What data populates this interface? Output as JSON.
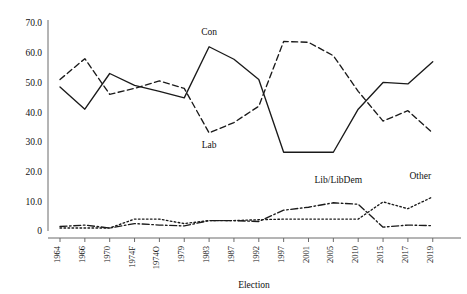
{
  "chart_data": {
    "type": "line",
    "title": "",
    "xlabel": "Election",
    "ylabel": "",
    "ylim": [
      0,
      75
    ],
    "yticks": [
      0,
      10,
      20,
      30,
      40,
      50,
      60,
      70
    ],
    "ytick_labels": [
      "0",
      "10.0",
      "20.0",
      "30.0",
      "40.0",
      "50.0",
      "60.0",
      "70.0"
    ],
    "grid": false,
    "legend_position": "inline-annotations",
    "categories": [
      "1964",
      "1966",
      "1970",
      "1974F",
      "1974O",
      "1979",
      "1983",
      "1987",
      "1992",
      "1997",
      "2001",
      "2005",
      "2010",
      "2015",
      "2017",
      "2019"
    ],
    "series": [
      {
        "name": "Con",
        "style": "solid",
        "values": [
          48.5,
          41.0,
          53.0,
          49.0,
          47.0,
          44.8,
          62.0,
          57.8,
          51.0,
          26.5,
          26.5,
          26.5,
          41.0,
          50.0,
          49.5,
          57.0
        ]
      },
      {
        "name": "Lab",
        "style": "dashed",
        "values": [
          51.0,
          58.0,
          46.0,
          48.0,
          50.5,
          48.0,
          33.0,
          36.5,
          42.0,
          63.8,
          63.5,
          59.0,
          47.0,
          37.0,
          40.5,
          33.0
        ]
      },
      {
        "name": "Lib/LibDem",
        "style": "dashdot",
        "values": [
          1.5,
          2.0,
          1.0,
          2.5,
          2.0,
          1.7,
          3.5,
          3.5,
          3.2,
          7.0,
          8.0,
          9.5,
          9.0,
          1.3,
          2.0,
          1.8
        ]
      },
      {
        "name": "Other",
        "style": "dotted",
        "values": [
          1.0,
          1.0,
          1.0,
          4.0,
          4.0,
          2.5,
          3.5,
          3.5,
          3.8,
          4.0,
          4.0,
          4.0,
          4.0,
          9.8,
          7.5,
          11.5
        ]
      }
    ],
    "annotations": [
      {
        "text": "Con",
        "x": 6,
        "y": 66
      },
      {
        "text": "Lab",
        "x": 6,
        "y": 28
      },
      {
        "text": "Lib/LibDem",
        "x": 11.2,
        "y": 16
      },
      {
        "text": "Other",
        "x": 14.5,
        "y": 17.5
      }
    ]
  }
}
